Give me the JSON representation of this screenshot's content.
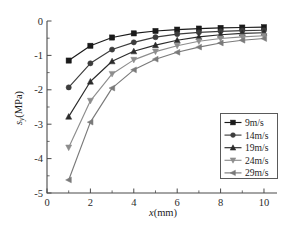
{
  "chart_data": {
    "type": "line",
    "title": "",
    "xlabel": "x(mm)",
    "ylabel": "sy(MPa)",
    "ylabel_base": "s",
    "ylabel_sub": "y",
    "ylabel_unit": "(MPa)",
    "xlabel_var": "x",
    "xlabel_unit": "(mm)",
    "xlim": [
      0,
      10.6
    ],
    "ylim": [
      -5,
      0
    ],
    "xticks": [
      0,
      2,
      4,
      6,
      8,
      10
    ],
    "xticklabels": [
      "0",
      "2",
      "4",
      "6",
      "8",
      "10"
    ],
    "xminorticks": [
      1,
      3,
      5,
      7,
      9
    ],
    "yticks": [
      0,
      -1,
      -2,
      -3,
      -4,
      -5
    ],
    "yticklabels": [
      "0",
      "-1",
      "-2",
      "-3",
      "-4",
      "-5"
    ],
    "yminorticks": [
      -0.5,
      -1.5,
      -2.5,
      -3.5,
      -4.5
    ],
    "grid": false,
    "legend_position": "lower-right",
    "x": [
      1,
      2,
      3,
      4,
      5,
      6,
      7,
      8,
      9,
      10
    ],
    "series": [
      {
        "name": "9m/s",
        "marker": "square",
        "color": "#1a1a1a",
        "values": [
          -1.15,
          -0.72,
          -0.48,
          -0.36,
          -0.29,
          -0.25,
          -0.22,
          -0.2,
          -0.19,
          -0.18
        ]
      },
      {
        "name": "14m/s",
        "marker": "circle",
        "color": "#3d3d3d",
        "values": [
          -1.93,
          -1.23,
          -0.83,
          -0.62,
          -0.47,
          -0.38,
          -0.33,
          -0.3,
          -0.28,
          -0.27
        ]
      },
      {
        "name": "19m/s",
        "marker": "triangle-up",
        "color": "#2b2b2b",
        "values": [
          -2.78,
          -1.76,
          -1.17,
          -0.88,
          -0.7,
          -0.56,
          -0.46,
          -0.4,
          -0.36,
          -0.34
        ]
      },
      {
        "name": "24m/s",
        "marker": "triangle-down",
        "color": "#8d8d8d",
        "values": [
          -3.68,
          -2.32,
          -1.54,
          -1.13,
          -0.89,
          -0.72,
          -0.59,
          -0.51,
          -0.46,
          -0.43
        ]
      },
      {
        "name": "29m/s",
        "marker": "triangle-left",
        "color": "#7a7a7a",
        "values": [
          -4.62,
          -2.94,
          -1.95,
          -1.42,
          -1.11,
          -0.91,
          -0.76,
          -0.64,
          -0.56,
          -0.51
        ]
      }
    ],
    "legend_entries": [
      "9m/s",
      "14m/s",
      "19m/s",
      "24m/s",
      "29m/s"
    ]
  }
}
